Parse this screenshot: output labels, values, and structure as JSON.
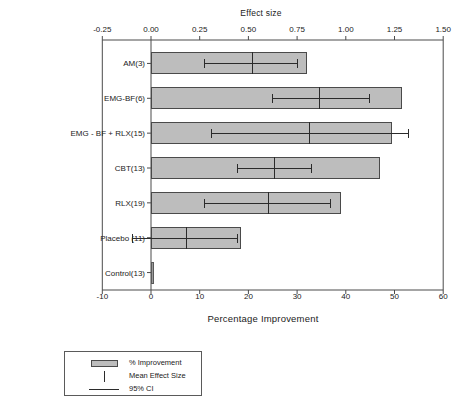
{
  "chart_data": {
    "type": "bar",
    "title": "",
    "orientation": "horizontal",
    "top_axis": {
      "label": "Effect size",
      "ticks": [
        "-0.25",
        "0.00",
        "0.25",
        "0.50",
        "0.75",
        "1.00",
        "1.25",
        "1.50"
      ],
      "tick_values": [
        -0.25,
        0.0,
        0.25,
        0.5,
        0.75,
        1.0,
        1.25,
        1.5
      ],
      "range": [
        -0.25,
        1.5
      ]
    },
    "bottom_axis": {
      "label": "Percentage Improvement",
      "ticks": [
        "-10",
        "0",
        "10",
        "20",
        "30",
        "40",
        "50",
        "60"
      ],
      "tick_values": [
        -10,
        0,
        10,
        20,
        30,
        40,
        50,
        60
      ],
      "range": [
        -10,
        60
      ]
    },
    "categories": [
      "AM(3)",
      "EMG-BF(6)",
      "EMG - BF  + RLX(15)",
      "CBT(13)",
      "RLX(19)",
      "Placebo (11)",
      "Control(13)"
    ],
    "series": [
      {
        "name": "% Improvement",
        "axis": "bottom",
        "units": "percent",
        "values": [
          32.0,
          51.5,
          49.5,
          47.0,
          39.0,
          18.5,
          0.3
        ]
      },
      {
        "name": "Mean Effect Size",
        "axis": "top",
        "units": "effect-size",
        "values": [
          0.52,
          0.86,
          0.81,
          0.63,
          0.6,
          0.18,
          0.0
        ]
      },
      {
        "name": "95% CI",
        "axis": "top",
        "units": "effect-size",
        "lower": [
          0.27,
          0.62,
          0.31,
          0.44,
          0.27,
          -0.1,
          null
        ],
        "upper": [
          0.75,
          1.12,
          1.32,
          0.82,
          0.92,
          0.44,
          null
        ]
      }
    ],
    "grid": false,
    "legend": {
      "position": "below-left",
      "entries": [
        {
          "label": "% Improvement",
          "symbol": "filled-bar",
          "color": "#bdbdbd"
        },
        {
          "label": "Mean Effect Size",
          "symbol": "vertical-line",
          "color": "#2b2b2b"
        },
        {
          "label": "95% CI",
          "symbol": "horizontal-line",
          "color": "#2b2b2b"
        }
      ]
    },
    "colors": {
      "bar_fill": "#bdbdbd",
      "bar_stroke": "#4a4a4a",
      "marker": "#2b2b2b",
      "axis": "#4a4a4a",
      "text": "#222222",
      "background": "#ffffff"
    }
  }
}
